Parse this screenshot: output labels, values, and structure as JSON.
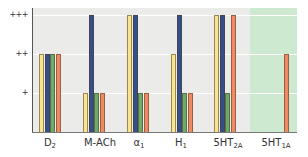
{
  "chart_data": {
    "type": "bar",
    "title": "",
    "xlabel": "",
    "ylabel": "",
    "categories": [
      "D2",
      "M-ACh",
      "α1",
      "H1",
      "5HT2A",
      "5HT1A"
    ],
    "category_display": [
      {
        "main": "D",
        "sub": "2"
      },
      {
        "main": "M-ACh",
        "sub": ""
      },
      {
        "main": "α",
        "sub": "1"
      },
      {
        "main": "H",
        "sub": "1"
      },
      {
        "main": "5HT",
        "sub": "2A"
      },
      {
        "main": "5HT",
        "sub": "1A"
      }
    ],
    "y_ticks": [
      {
        "value": 1,
        "label": "+"
      },
      {
        "value": 2,
        "label": "++"
      },
      {
        "value": 3,
        "label": "+++"
      }
    ],
    "ylim": [
      0,
      3.15
    ],
    "grid": true,
    "legend": null,
    "highlighted_category": "5HT1A",
    "highlight_color": "#cde9cf",
    "series": [
      {
        "name": "series-yellow",
        "color": "#f7e48c",
        "values": [
          2,
          1,
          3,
          2,
          3,
          0
        ]
      },
      {
        "name": "series-blue",
        "color": "#34508a",
        "values": [
          2,
          3,
          3,
          3,
          3,
          0
        ]
      },
      {
        "name": "series-green",
        "color": "#6aab6a",
        "values": [
          2,
          1,
          1,
          1,
          1,
          0
        ]
      },
      {
        "name": "series-orange",
        "color": "#f08a63",
        "values": [
          2,
          1,
          1,
          1,
          3,
          2
        ]
      }
    ]
  }
}
